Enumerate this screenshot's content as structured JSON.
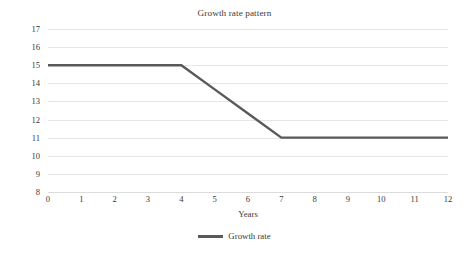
{
  "chart_data": {
    "type": "line",
    "title": "Growth rate pattern",
    "xlabel": "Years",
    "ylabel": "Dividend growth rate",
    "xlim": [
      0,
      12
    ],
    "ylim": [
      8,
      17
    ],
    "x_ticks": [
      0,
      1,
      2,
      3,
      4,
      5,
      6,
      7,
      8,
      9,
      10,
      11,
      12
    ],
    "y_ticks": [
      8,
      9,
      10,
      11,
      12,
      13,
      14,
      15,
      16,
      17
    ],
    "grid": "horizontal",
    "legend_position": "bottom-center",
    "series": [
      {
        "name": "Growth rate",
        "color": "#595959",
        "x": [
          0,
          1,
          2,
          3,
          4,
          5,
          6,
          7,
          8,
          9,
          10,
          11,
          12
        ],
        "values": [
          15,
          15,
          15,
          15,
          15,
          13.667,
          12.333,
          11,
          11,
          11,
          11,
          11,
          11
        ]
      }
    ],
    "annotations": []
  },
  "legend": {
    "entries": [
      {
        "label": "Growth rate",
        "swatch": "line-swatch"
      }
    ]
  },
  "colors": {
    "line": "#595959",
    "gridline": "#e6e6e6",
    "text": "#3a3a3a",
    "background": "#ffffff"
  }
}
